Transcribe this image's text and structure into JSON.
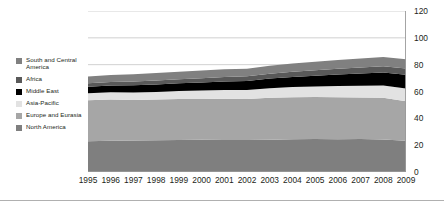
{
  "chart_data": {
    "type": "area",
    "stacked": true,
    "title": "",
    "subtitle": "",
    "xlabel": "",
    "ylabel": "",
    "categories": [
      "1995",
      "1996",
      "1997",
      "1998",
      "1999",
      "2000",
      "2001",
      "2002",
      "2003",
      "2004",
      "2005",
      "2006",
      "2007",
      "2008",
      "2009"
    ],
    "ylim": [
      0,
      120
    ],
    "yticks": [
      0,
      20,
      40,
      60,
      80,
      100,
      120
    ],
    "grid": true,
    "legend_position": "left",
    "series": [
      {
        "name": "North America",
        "color": "#7f7f7f",
        "values": [
          23.0,
          23.2,
          23.5,
          23.6,
          23.8,
          24.0,
          23.8,
          23.9,
          24.1,
          24.5,
          24.6,
          24.4,
          24.6,
          24.2,
          23.3
        ]
      },
      {
        "name": "Europe and Eurasia",
        "color": "#a6a6a6",
        "values": [
          30.5,
          30.8,
          30.2,
          30.4,
          30.6,
          30.4,
          30.8,
          30.5,
          31.2,
          31.3,
          31.3,
          31.4,
          31.0,
          31.2,
          29.4
        ]
      },
      {
        "name": "Asia-Pacific",
        "color": "#e2e2e2",
        "values": [
          5.2,
          5.4,
          5.6,
          5.7,
          6.0,
          6.3,
          6.5,
          6.8,
          7.2,
          7.6,
          7.9,
          8.3,
          8.6,
          9.0,
          9.5
        ]
      },
      {
        "name": "Middle East",
        "color": "#000000",
        "values": [
          4.8,
          5.0,
          5.3,
          5.6,
          5.8,
          6.1,
          6.4,
          6.7,
          7.1,
          7.5,
          8.0,
          8.6,
          9.2,
          9.8,
          10.2
        ]
      },
      {
        "name": "Africa",
        "color": "#595959",
        "values": [
          2.6,
          2.7,
          2.8,
          2.9,
          3.0,
          3.1,
          3.3,
          3.4,
          3.6,
          3.8,
          4.0,
          4.2,
          4.4,
          4.6,
          4.7
        ]
      },
      {
        "name": "South and Central America",
        "color": "#808080",
        "values": [
          5.1,
          5.2,
          5.4,
          5.5,
          5.6,
          5.7,
          5.7,
          5.7,
          5.9,
          6.1,
          6.3,
          6.5,
          6.8,
          7.0,
          7.0
        ]
      }
    ],
    "totals": [
      71.2,
      72.3,
      72.8,
      73.7,
      74.8,
      75.6,
      76.5,
      77.0,
      79.1,
      80.8,
      82.1,
      83.4,
      84.6,
      85.8,
      84.1
    ]
  },
  "legend": {
    "items": [
      {
        "label": "South and Central\nAmerica",
        "color": "#808080",
        "two_line": true
      },
      {
        "label": "Africa",
        "color": "#595959",
        "two_line": false
      },
      {
        "label": "Middle East",
        "color": "#000000",
        "two_line": false
      },
      {
        "label": "Asia-Pacific",
        "color": "#e2e2e2",
        "two_line": false
      },
      {
        "label": "Europe and Eurasia",
        "color": "#a6a6a6",
        "two_line": false
      },
      {
        "label": "North America",
        "color": "#7f7f7f",
        "two_line": false
      }
    ]
  }
}
